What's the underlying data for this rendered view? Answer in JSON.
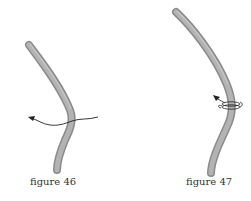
{
  "figures": [
    {
      "id": "figure-46",
      "caption": "figure 46",
      "description": "curved rod with arrowed wavy line crossing it"
    },
    {
      "id": "figure-47",
      "caption": "figure 47",
      "description": "curved rod with thread wrapped around it and arrow pointing up-left"
    }
  ],
  "colors": {
    "rod_fill": "#a9a9a9",
    "rod_edge": "#8a8a8a",
    "line": "#222222",
    "background": "#ffffff"
  }
}
